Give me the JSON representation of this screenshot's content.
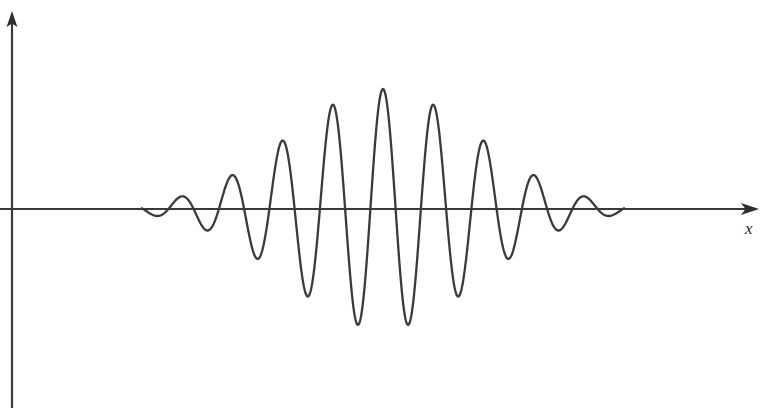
{
  "figure": {
    "title": "",
    "background_color": "#ffffff",
    "width": 771,
    "height": 408
  },
  "axes": {
    "x_axis": {
      "label": "x",
      "color": "#3a3a3a",
      "arrow": "arrow-right",
      "baseline_y": 209,
      "start_x": 12,
      "end_x": 757
    },
    "y_axis": {
      "label": "",
      "color": "#3a3a3a",
      "arrow": "arrow-up",
      "axis_x": 12,
      "top_y": 14,
      "bottom_y": 408
    }
  },
  "chart_data": {
    "type": "line",
    "title": "",
    "xlabel": "x",
    "ylabel": "",
    "grid": false,
    "legend": null,
    "curve": {
      "name": "wave-packet",
      "color": "#3a3a3a",
      "stroke_width": 2.3,
      "form": "gaussian_modulated_sine",
      "center_x": 383,
      "wavelength_px": 50.5,
      "envelope_sigma_px": 95,
      "max_amplitude_px": 120,
      "baseline_y": 209,
      "x_start": 142,
      "x_end": 624,
      "phase_deg": 90
    },
    "xlim": [
      142,
      624
    ],
    "ylim": [
      -120,
      120
    ],
    "peaks": [
      {
        "x": 158,
        "y": 196,
        "amplitude": 13
      },
      {
        "x": 208,
        "y": 179,
        "amplitude": 30
      },
      {
        "x": 258,
        "y": 158,
        "amplitude": 51
      },
      {
        "x": 308,
        "y": 131,
        "amplitude": 78
      },
      {
        "x": 355,
        "y": 92,
        "amplitude": 117
      },
      {
        "x": 405,
        "y": 90,
        "amplitude": 119
      },
      {
        "x": 455,
        "y": 134,
        "amplitude": 75
      },
      {
        "x": 505,
        "y": 163,
        "amplitude": 46
      },
      {
        "x": 556,
        "y": 181,
        "amplitude": 28
      },
      {
        "x": 606,
        "y": 197,
        "amplitude": 12
      }
    ],
    "troughs": [
      {
        "x": 183,
        "y": 230,
        "amplitude": -21
      },
      {
        "x": 233,
        "y": 247,
        "amplitude": -38
      },
      {
        "x": 283,
        "y": 272,
        "amplitude": -63
      },
      {
        "x": 330,
        "y": 304,
        "amplitude": -95
      },
      {
        "x": 383,
        "y": 330,
        "amplitude": -121
      },
      {
        "x": 430,
        "y": 300,
        "amplitude": -91
      },
      {
        "x": 480,
        "y": 265,
        "amplitude": -56
      },
      {
        "x": 530,
        "y": 243,
        "amplitude": -34
      },
      {
        "x": 581,
        "y": 228,
        "amplitude": -19
      }
    ]
  }
}
